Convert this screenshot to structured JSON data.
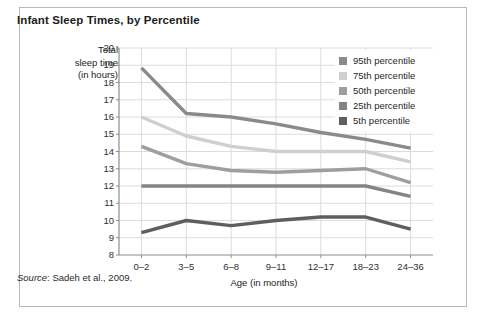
{
  "figure": {
    "title": "Infant Sleep Times, by Percentile",
    "source_label": "Source",
    "source_text": ": Sadeh et al., 2009."
  },
  "chart_data": {
    "type": "line",
    "title": "Infant Sleep Times, by Percentile",
    "xlabel": "Age (in months)",
    "ylabel": "Total sleep time (in hours)",
    "ylabel_lines": [
      "Total",
      "sleep time",
      "(in hours)"
    ],
    "categories": [
      "0–2",
      "3–5",
      "6–8",
      "9–11",
      "12–17",
      "18–23",
      "24–36"
    ],
    "ylim": [
      8,
      20
    ],
    "yticks": [
      20,
      19,
      18,
      17,
      16,
      15,
      14,
      13,
      12,
      11,
      10,
      9,
      8
    ],
    "grid": true,
    "legend_position": "top-right",
    "series": [
      {
        "name": "95th percentile",
        "color": "#8a8a8a",
        "values": [
          18.85,
          16.2,
          16.0,
          15.6,
          15.1,
          14.7,
          14.2
        ]
      },
      {
        "name": "75th percentile",
        "color": "#cfcfcf",
        "values": [
          16.0,
          14.9,
          14.3,
          14.0,
          14.0,
          14.0,
          13.4
        ]
      },
      {
        "name": "50th percentile",
        "color": "#9e9e9e",
        "values": [
          14.3,
          13.3,
          12.9,
          12.8,
          12.9,
          13.0,
          12.2
        ]
      },
      {
        "name": "25th percentile",
        "color": "#848484",
        "values": [
          12.0,
          12.0,
          12.0,
          12.0,
          12.0,
          12.0,
          11.4
        ]
      },
      {
        "name": "5th percentile",
        "color": "#5e5e5e",
        "values": [
          9.3,
          10.0,
          9.7,
          10.0,
          10.2,
          10.2,
          9.5
        ]
      }
    ]
  },
  "legend": {
    "items": [
      {
        "label": "95th percentile",
        "color": "#8a8a8a"
      },
      {
        "label": "75th percentile",
        "color": "#cfcfcf"
      },
      {
        "label": "50th percentile",
        "color": "#9e9e9e"
      },
      {
        "label": "25th percentile",
        "color": "#848484"
      },
      {
        "label": "5th percentile",
        "color": "#5e5e5e"
      }
    ]
  },
  "axes": {
    "y_ticks": [
      "20",
      "19",
      "18",
      "17",
      "16",
      "15",
      "14",
      "13",
      "12",
      "11",
      "10",
      "9",
      "8"
    ],
    "x_ticks": [
      "0–2",
      "3–5",
      "6–8",
      "9–11",
      "12–17",
      "18–23",
      "24–36"
    ]
  }
}
